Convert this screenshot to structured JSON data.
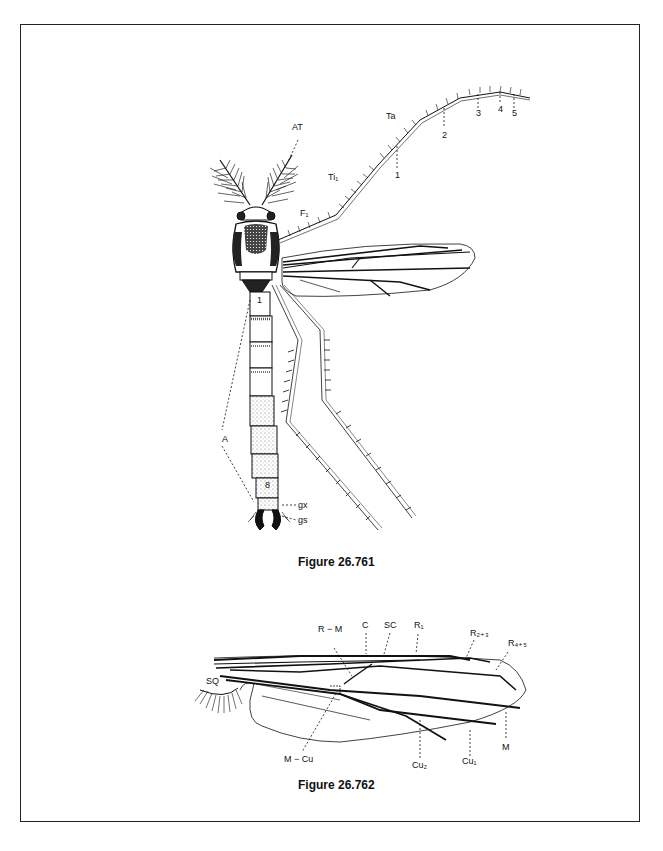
{
  "page": {
    "figures": [
      {
        "id": "fig1",
        "caption": "Figure 26.761",
        "labels": {
          "AT": "AT",
          "Ta": "Ta",
          "Ti1": "Ti₁",
          "F1": "F₁",
          "T": "T",
          "seg1": "1",
          "A": "A",
          "seg8": "8",
          "gx": "gx",
          "gs": "gs",
          "tarsus": [
            "1",
            "2",
            "3",
            "4",
            "5"
          ]
        }
      },
      {
        "id": "fig2",
        "caption": "Figure 26.762",
        "labels": {
          "RM": "R − M",
          "C": "C",
          "SC": "SC",
          "R1": "R₁",
          "R23": "R₂₊₃",
          "R45": "R₄₊₅",
          "SQ": "SQ",
          "MCu": "M − Cu",
          "Cu2": "Cu₂",
          "Cu1": "Cu₁",
          "M": "M"
        }
      }
    ]
  }
}
